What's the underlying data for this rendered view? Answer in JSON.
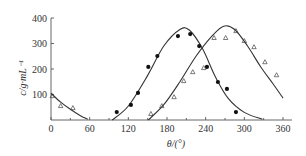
{
  "chart_data": {
    "type": "scatter",
    "title": "",
    "xlabel": "θ/(°)",
    "ylabel": "c/g·mL⁻¹",
    "xlim": [
      0,
      360
    ],
    "ylim": [
      0,
      400
    ],
    "x_ticks": [
      0,
      60,
      120,
      180,
      240,
      300,
      360
    ],
    "y_ticks": [
      100,
      200,
      300,
      400
    ],
    "x_tick_labels": [
      "0",
      "60",
      "120",
      "180",
      "240",
      "300",
      "360"
    ],
    "y_tick_labels": [
      "100",
      "200",
      "300",
      "400"
    ],
    "grid": false,
    "legend": null,
    "series": [
      {
        "name": "filled circles",
        "marker": "circle-filled",
        "points": [
          [
            102,
            31
          ],
          [
            124,
            59
          ],
          [
            135,
            106
          ],
          [
            151,
            208
          ],
          [
            165,
            251
          ],
          [
            197,
            329
          ],
          [
            216,
            337
          ],
          [
            230,
            290
          ],
          [
            242,
            208
          ],
          [
            259,
            149
          ],
          [
            273,
            122
          ],
          [
            287,
            31
          ]
        ],
        "fit_curve": [
          [
            95,
            0
          ],
          [
            120,
            55
          ],
          [
            150,
            175
          ],
          [
            175,
            290
          ],
          [
            200,
            355
          ],
          [
            215,
            352
          ],
          [
            235,
            280
          ],
          [
            255,
            170
          ],
          [
            275,
            85
          ],
          [
            300,
            30
          ],
          [
            328,
            3
          ]
        ]
      },
      {
        "name": "open triangles",
        "marker": "triangle-open",
        "points": [
          [
            2,
            94
          ],
          [
            15,
            55
          ],
          [
            34,
            47
          ],
          [
            155,
            24
          ],
          [
            172,
            55
          ],
          [
            191,
            90
          ],
          [
            206,
            153
          ],
          [
            220,
            188
          ],
          [
            237,
            204
          ],
          [
            253,
            322
          ],
          [
            271,
            322
          ],
          [
            287,
            349
          ],
          [
            300,
            310
          ],
          [
            315,
            286
          ],
          [
            332,
            227
          ],
          [
            350,
            176
          ]
        ],
        "fit_curve_left": [
          [
            0,
            105
          ],
          [
            15,
            70
          ],
          [
            30,
            42
          ],
          [
            45,
            18
          ],
          [
            57,
            3
          ]
        ],
        "fit_curve": [
          [
            151,
            0
          ],
          [
            175,
            60
          ],
          [
            200,
            150
          ],
          [
            225,
            250
          ],
          [
            250,
            330
          ],
          [
            268,
            368
          ],
          [
            285,
            355
          ],
          [
            305,
            290
          ],
          [
            325,
            210
          ],
          [
            345,
            140
          ],
          [
            360,
            86
          ]
        ]
      }
    ]
  }
}
